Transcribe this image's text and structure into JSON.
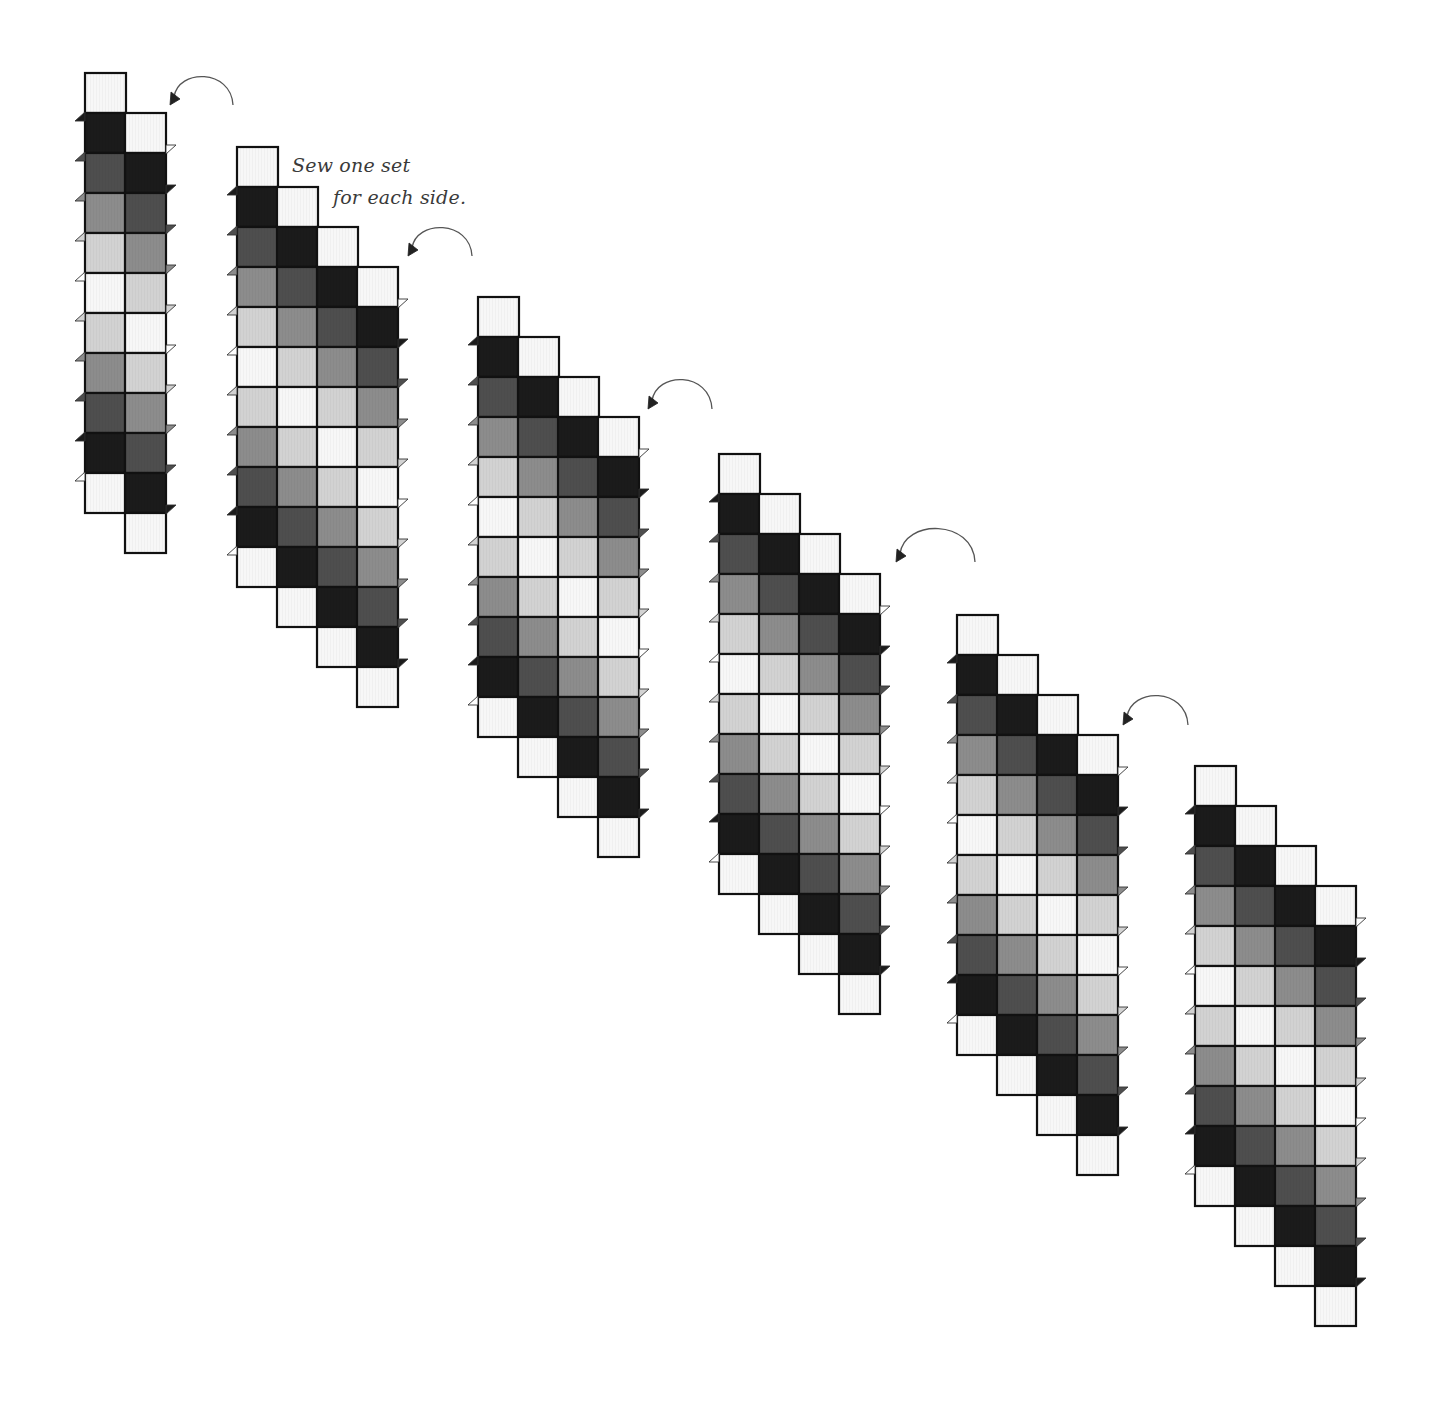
{
  "diagram": {
    "caption": {
      "line1": "Sew one set",
      "line2": "for each side."
    },
    "palette": {
      "W": "#f7f7f7",
      "K": "#1b1b1b",
      "D": "#4e4e4e",
      "M": "#8c8c8c",
      "L": "#d2d2d2"
    },
    "column_sequence": [
      "W",
      "K",
      "D",
      "M",
      "L",
      "W",
      "L",
      "M",
      "D",
      "K",
      "W"
    ],
    "square": {
      "w": 41,
      "h": 40,
      "col_step_x": 40,
      "col_step_y": 40
    },
    "strip_sets": [
      {
        "id": 1,
        "x": 85,
        "y": 73,
        "columns": 2
      },
      {
        "id": 2,
        "x": 237,
        "y": 147,
        "columns": 4
      },
      {
        "id": 3,
        "x": 478,
        "y": 297,
        "columns": 4
      },
      {
        "id": 4,
        "x": 719,
        "y": 454,
        "columns": 4
      },
      {
        "id": 5,
        "x": 957,
        "y": 615,
        "columns": 4
      },
      {
        "id": 6,
        "x": 1195,
        "y": 766,
        "columns": 4
      }
    ],
    "arrows": [
      {
        "from": [
          233,
          105
        ],
        "to": [
          170,
          105
        ],
        "peak": 78
      },
      {
        "from": [
          472,
          256
        ],
        "to": [
          408,
          256
        ],
        "peak": 229
      },
      {
        "from": [
          712,
          409
        ],
        "to": [
          648,
          409
        ],
        "peak": 381
      },
      {
        "from": [
          975,
          562
        ],
        "to": [
          896,
          562
        ],
        "peak": 530
      },
      {
        "from": [
          1188,
          725
        ],
        "to": [
          1123,
          725
        ],
        "peak": 697
      }
    ]
  }
}
